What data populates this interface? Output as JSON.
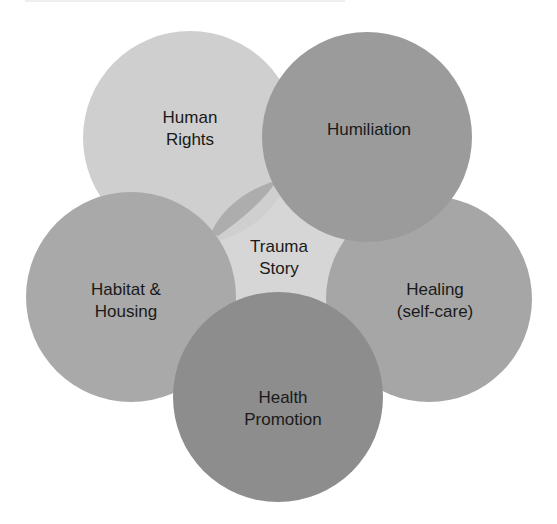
{
  "diagram": {
    "center": {
      "label_lines": [
        "Trauma",
        "Story"
      ],
      "color": "#d6d6d6"
    },
    "nodes": [
      {
        "id": "human-rights",
        "label_lines": [
          "Human",
          "Rights"
        ],
        "color": "#cfcfcf"
      },
      {
        "id": "humiliation",
        "label_lines": [
          "Humiliation"
        ],
        "color": "#9b9b9b"
      },
      {
        "id": "healing",
        "label_lines": [
          "Healing",
          "(self-care)"
        ],
        "color": "#a6a6a6"
      },
      {
        "id": "health-promotion",
        "label_lines": [
          "Health",
          "Promotion"
        ],
        "color": "#8d8d8d"
      },
      {
        "id": "habitat-housing",
        "label_lines": [
          "Habitat &",
          "Housing"
        ],
        "color": "#a9a9a9"
      }
    ],
    "overlap_color": "#adadad"
  }
}
